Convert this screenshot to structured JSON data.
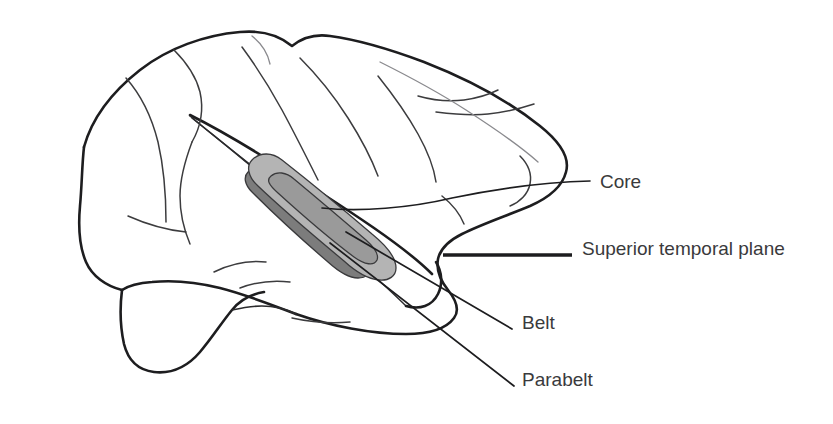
{
  "figure": {
    "background_color": "#ffffff",
    "outline_color": "#1d1d1f",
    "text_color": "#3a3a3c"
  },
  "labels": [
    {
      "id": "core",
      "text": "Core",
      "x": 600,
      "y": 183,
      "leader_kind": "thin",
      "color": "#3a3a3c"
    },
    {
      "id": "superior-temporal-plane",
      "text": "Superior temporal plane",
      "x": 582,
      "y": 250,
      "leader_kind": "thick",
      "color": "#3a3a3c"
    },
    {
      "id": "belt",
      "text": "Belt",
      "x": 522,
      "y": 324,
      "leader_kind": "thin",
      "color": "#3a3a3c"
    },
    {
      "id": "parabelt",
      "text": "Parabelt",
      "x": 522,
      "y": 381,
      "leader_kind": "thin",
      "color": "#3a3a3c"
    }
  ],
  "regions": [
    {
      "id": "parabelt-region",
      "name": "Parabelt",
      "fill": "#7c7c7c",
      "description": "dark gray inferior band along superior temporal gyrus"
    },
    {
      "id": "belt-region",
      "name": "Belt",
      "fill": "#b4b4b4",
      "description": "light gray band surrounding the core"
    },
    {
      "id": "core-region",
      "name": "Core",
      "fill": "#9a9a9a",
      "description": "medium gray innermost oval on supratemporal plane"
    }
  ],
  "anatomy": {
    "view": "lateral",
    "structures": [
      "cerebral hemisphere outline",
      "sylvian fissure",
      "superior temporal gyrus",
      "temporal pole",
      "cerebellum",
      "cortical sulci"
    ]
  }
}
